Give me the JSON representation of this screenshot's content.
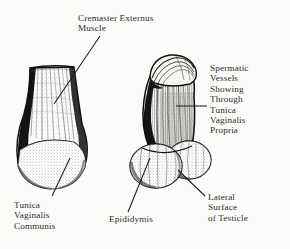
{
  "plate": {
    "title": "Cremaster Externus Muscle",
    "background_color": "#fbfbf9",
    "ink_color": "#2b2b2b",
    "style": "engraving"
  },
  "labels": {
    "cremaster": "Cremaster Externus\nMuscle",
    "spermatic": "Spermatic\nVessels\nShowing\nThrough\nTunica\nVaginalis\nPropria",
    "tunica_communis": "Tunica\nVaginalis\nCommunis",
    "epididymis": "Epididymis",
    "lateral_surface": "Lateral\nSurface\nof Testicle"
  },
  "figures": {
    "left": {
      "name": "left-specimen",
      "description": "Testicle enclosed in tunica vaginalis communis, cremaster externus muscle fibers over upper portion"
    },
    "right": {
      "name": "right-specimen",
      "description": "Testicle with spermatic vessels showing through tunica vaginalis propria, epididymis and lateral surface exposed"
    }
  },
  "leader_lines": [
    {
      "name": "leader-cremaster",
      "from": "cremaster",
      "to": "left-specimen-upper"
    },
    {
      "name": "leader-spermatic",
      "from": "spermatic",
      "to": "right-specimen-body"
    },
    {
      "name": "leader-tunica-communis",
      "from": "tunica_communis",
      "to": "left-specimen-lower"
    },
    {
      "name": "leader-epididymis",
      "from": "epididymis",
      "to": "right-specimen-left-lobe"
    },
    {
      "name": "leader-lateral-surface",
      "from": "lateral_surface",
      "to": "right-specimen-right-lobe"
    }
  ]
}
